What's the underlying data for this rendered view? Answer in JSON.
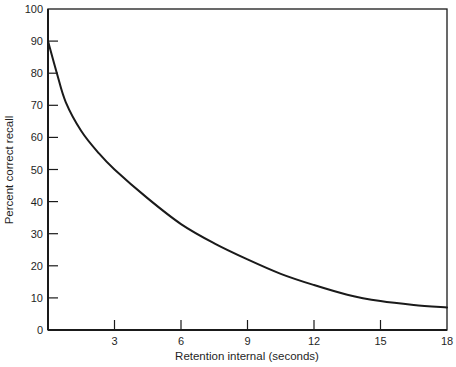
{
  "chart_data": {
    "type": "line",
    "title": "",
    "xlabel": "Retention internal (seconds)",
    "ylabel": "Percent correct recall",
    "xlim": [
      0,
      18
    ],
    "ylim": [
      0,
      100
    ],
    "grid": false,
    "legend": null,
    "x_ticks": [
      3,
      6,
      9,
      12,
      15,
      18
    ],
    "x_tick_labels": [
      "3",
      "6",
      "9",
      "12",
      "15",
      "18"
    ],
    "y_ticks": [
      0,
      10,
      20,
      30,
      40,
      50,
      60,
      70,
      80,
      90,
      100
    ],
    "y_tick_labels": [
      "0",
      "10",
      "20",
      "30",
      "40",
      "50",
      "60",
      "70",
      "80",
      "90",
      "100"
    ],
    "series": [
      {
        "name": "Recall",
        "color": "#1a1a1a",
        "x": [
          0,
          0.4,
          0.8,
          1.5,
          2.3,
          3,
          4.5,
          6,
          7.5,
          9,
          10.5,
          12,
          13.5,
          15,
          16.5,
          18
        ],
        "values": [
          90,
          80,
          71,
          62,
          55,
          50,
          41,
          33,
          27,
          22,
          17.5,
          14,
          11,
          9,
          7.8,
          7
        ]
      }
    ]
  },
  "style": {
    "axis_color": "#1a1a1a",
    "line_color": "#1a1a1a",
    "background": "#ffffff"
  }
}
